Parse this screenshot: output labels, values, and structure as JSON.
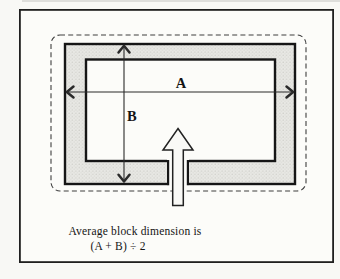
{
  "figure": {
    "dimension_labels": {
      "horizontal": "A",
      "vertical": "B"
    },
    "caption_line1": "Average block dimension is",
    "caption_line2": "(A + B) ÷ 2",
    "icon_meanings": {
      "entrance_up_arrow": "hollow up-arrow entering block opening"
    }
  },
  "colors": {
    "paper": "#f8f8f5",
    "frame_border": "#1f1f1f",
    "block_fill": "#e8e8e4",
    "block_stipple": "#bfbfb9",
    "block_outline": "#161616",
    "dashed_outline": "#3f3f3f",
    "dimension_line": "#2a2a2a",
    "arrow_fill": "#f9f9f6",
    "text": "#141414"
  }
}
